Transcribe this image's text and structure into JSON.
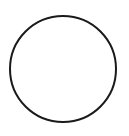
{
  "canvas": {
    "width": 129,
    "height": 136,
    "background": "#ffffff"
  },
  "shape": {
    "type": "circle",
    "cx": 63,
    "cy": 69,
    "r": 53,
    "stroke": "#1a1a1a",
    "stroke_width": 2,
    "fill": "none"
  }
}
